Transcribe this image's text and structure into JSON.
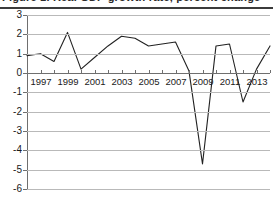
{
  "figure": {
    "title": "Figure 1. Real GDP growth rate, percent change",
    "title_clipped": true
  },
  "chart_data": {
    "type": "line",
    "title": "Figure 1. Real GDP growth rate, percent change",
    "xlabel": "",
    "ylabel": "",
    "xlim": [
      1996,
      2014
    ],
    "ylim": [
      -6,
      3
    ],
    "grid": true,
    "legend": "none",
    "y_ticks": [
      3,
      2,
      1,
      0,
      -1,
      -2,
      -3,
      -4,
      -5,
      -6
    ],
    "y_tick_labels": [
      "3",
      "2",
      "1",
      "0",
      "-1",
      "-2",
      "-3",
      "-4",
      "-5",
      "-6"
    ],
    "x_ticks": [
      1996,
      1997,
      1998,
      1999,
      2000,
      2001,
      2002,
      2003,
      2004,
      2005,
      2006,
      2007,
      2008,
      2009,
      2010,
      2011,
      2012,
      2013,
      2014
    ],
    "x_tick_labels": [
      "1997",
      "1999",
      "2001",
      "2003",
      "2005",
      "2007",
      "2009",
      "2011",
      "2013"
    ],
    "x_tick_label_years": [
      1997,
      1999,
      2001,
      2003,
      2005,
      2007,
      2009,
      2011,
      2013
    ],
    "series": [
      {
        "name": "Growth rate",
        "color": "#222222",
        "x": [
          1996,
          1997,
          1998,
          1999,
          2000,
          2001,
          2002,
          2003,
          2004,
          2005,
          2006,
          2007,
          2008,
          2009,
          2010,
          2011,
          2012,
          2013,
          2014
        ],
        "values": [
          0.9,
          1.0,
          0.6,
          2.1,
          0.2,
          0.8,
          1.4,
          1.9,
          1.8,
          1.4,
          1.5,
          1.6,
          0.1,
          -4.7,
          1.4,
          1.5,
          -1.5,
          0.2,
          1.4
        ]
      }
    ]
  }
}
